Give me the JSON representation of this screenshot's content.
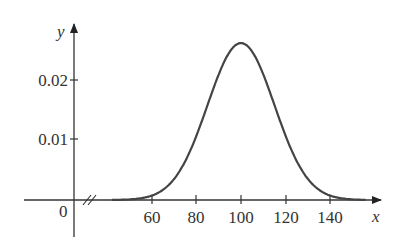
{
  "chart_data": {
    "type": "line",
    "title": "",
    "xlabel": "x",
    "ylabel": "y",
    "x_ticks": [
      "60",
      "80",
      "100",
      "120",
      "140"
    ],
    "y_ticks": [
      "0.01",
      "0.02"
    ],
    "origin_label": "0",
    "axis_break": true,
    "xlim": [
      40,
      160
    ],
    "ylim": [
      0,
      0.03
    ],
    "series": [
      {
        "name": "normal density, mean 100, sd 15",
        "x": [
          40,
          50,
          60,
          70,
          80,
          90,
          100,
          110,
          120,
          130,
          140,
          150,
          155
        ],
        "y": [
          0.0,
          0.0001,
          0.0011,
          0.0036,
          0.0109,
          0.0213,
          0.0266,
          0.0213,
          0.0109,
          0.0036,
          0.0011,
          0.0001,
          0.0
        ]
      }
    ],
    "grid": false,
    "legend": "none"
  }
}
